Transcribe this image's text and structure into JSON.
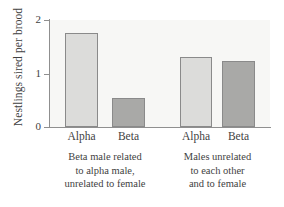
{
  "chart_data": {
    "type": "bar",
    "title": "",
    "xlabel": "",
    "ylabel": "Nestlings sired per brood",
    "ylim": [
      0,
      2
    ],
    "yticks": [
      "0",
      "1",
      "2"
    ],
    "ytick_values": [
      0,
      1,
      2
    ],
    "grid": false,
    "legend": "none",
    "categories": [
      "Alpha",
      "Beta",
      "Alpha",
      "Beta"
    ],
    "values": [
      1.75,
      0.55,
      1.3,
      1.24
    ],
    "bar_colors": [
      "#dcdcda",
      "#a9a9a7",
      "#dcdcda",
      "#a9a9a7"
    ],
    "groups": [
      {
        "caption_lines": [
          "Beta male related",
          "to alpha male,",
          "unrelated to female"
        ],
        "bars": [
          {
            "label": "Alpha",
            "value": 1.75,
            "shade": "light"
          },
          {
            "label": "Beta",
            "value": 0.55,
            "shade": "dark"
          }
        ]
      },
      {
        "caption_lines": [
          "Males unrelated",
          "to each other",
          "and to female"
        ],
        "bars": [
          {
            "label": "Alpha",
            "value": 1.3,
            "shade": "light"
          },
          {
            "label": "Beta",
            "value": 1.24,
            "shade": "dark"
          }
        ]
      }
    ]
  },
  "axis": {
    "y_title": "Nestlings sired per brood",
    "tick_2": "2",
    "tick_1": "1",
    "tick_0": "0"
  },
  "bars": {
    "b0": {
      "label": "Alpha"
    },
    "b1": {
      "label": "Beta"
    },
    "b2": {
      "label": "Alpha"
    },
    "b3": {
      "label": "Beta"
    }
  },
  "captions": {
    "g0_l0": "Beta male related",
    "g0_l1": "to alpha male,",
    "g0_l2": "unrelated to female",
    "g1_l0": "Males unrelated",
    "g1_l1": "to each other",
    "g1_l2": "and to female"
  },
  "colors": {
    "light_bar": "#dcdcda",
    "dark_bar": "#a9a9a7",
    "bar_outline": "#8a8a8a",
    "axis": "#8f8f8f",
    "plot_background": "#f7f7f5",
    "text": "#3f3f3f"
  }
}
